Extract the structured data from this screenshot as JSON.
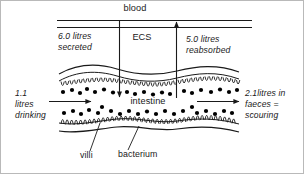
{
  "figure": {
    "type": "biological-diagram",
    "colors": {
      "stroke": "#1a1a1a",
      "bacterium_fill": "#000000",
      "background": "#ffffff",
      "border": "#b9b9b9"
    }
  },
  "labels": {
    "blood": "blood",
    "ecs": "ECS",
    "intestine": "intestine",
    "villi": "villi",
    "bacterium": "bacterium",
    "secreted_line1": "6.0 litres",
    "secreted_line2": "secreted",
    "reabsorbed_line1": "5.0 litres",
    "reabsorbed_line2": "reabsorbed",
    "drinking_line1": "1.1",
    "drinking_line2": "litres",
    "drinking_line3": "drinking",
    "faeces_line1": "2.1litres in",
    "faeces_line2": "faeces =",
    "faeces_line3": "scouring"
  },
  "flows": [
    {
      "name": "secreted",
      "volume_litres": 6.0,
      "direction": "blood-to-intestine",
      "arrow": "down"
    },
    {
      "name": "reabsorbed",
      "volume_litres": 5.0,
      "direction": "intestine-to-blood",
      "arrow": "up"
    },
    {
      "name": "drinking",
      "volume_litres": 1.1,
      "direction": "into-intestine",
      "arrow": "right"
    },
    {
      "name": "faeces",
      "volume_litres": 2.1,
      "direction": "out-of-intestine",
      "arrow": "right"
    }
  ],
  "structures": {
    "blood_vessel": "blood",
    "extracellular_space": "ECS",
    "lumen": "intestine",
    "epithelial_projections": "villi",
    "microbes": "bacterium"
  }
}
